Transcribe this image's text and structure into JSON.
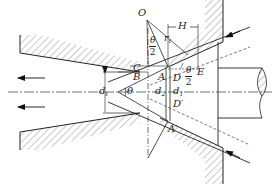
{
  "diagram": {
    "type": "wire drawing die geometry",
    "labels": {
      "O": "O",
      "r": "r",
      "r_sub": "t",
      "H": "H",
      "theta_half_top_num": "θ",
      "theta_half_top_den": "2",
      "C": "C",
      "B": "B",
      "A": "A",
      "D": "D",
      "E": "E",
      "theta_half_right_num": "θ",
      "theta_half_right_den": "2",
      "d_left": "d",
      "d_left_sub": "t",
      "theta": "θ",
      "d2": "d",
      "d2_sub": "2",
      "d1": "d",
      "d1_sub": "1",
      "D_prime": "D′",
      "A_prime": "A′"
    },
    "arrows": {
      "left_flow": [
        "upper-left arrow",
        "lower-left arrow"
      ],
      "incoming": [
        "upper-right arrow",
        "lower-right arrow"
      ]
    },
    "colors": {
      "line": "#2a2a2a",
      "hatch": "#555555",
      "background": "#ffffff"
    }
  }
}
